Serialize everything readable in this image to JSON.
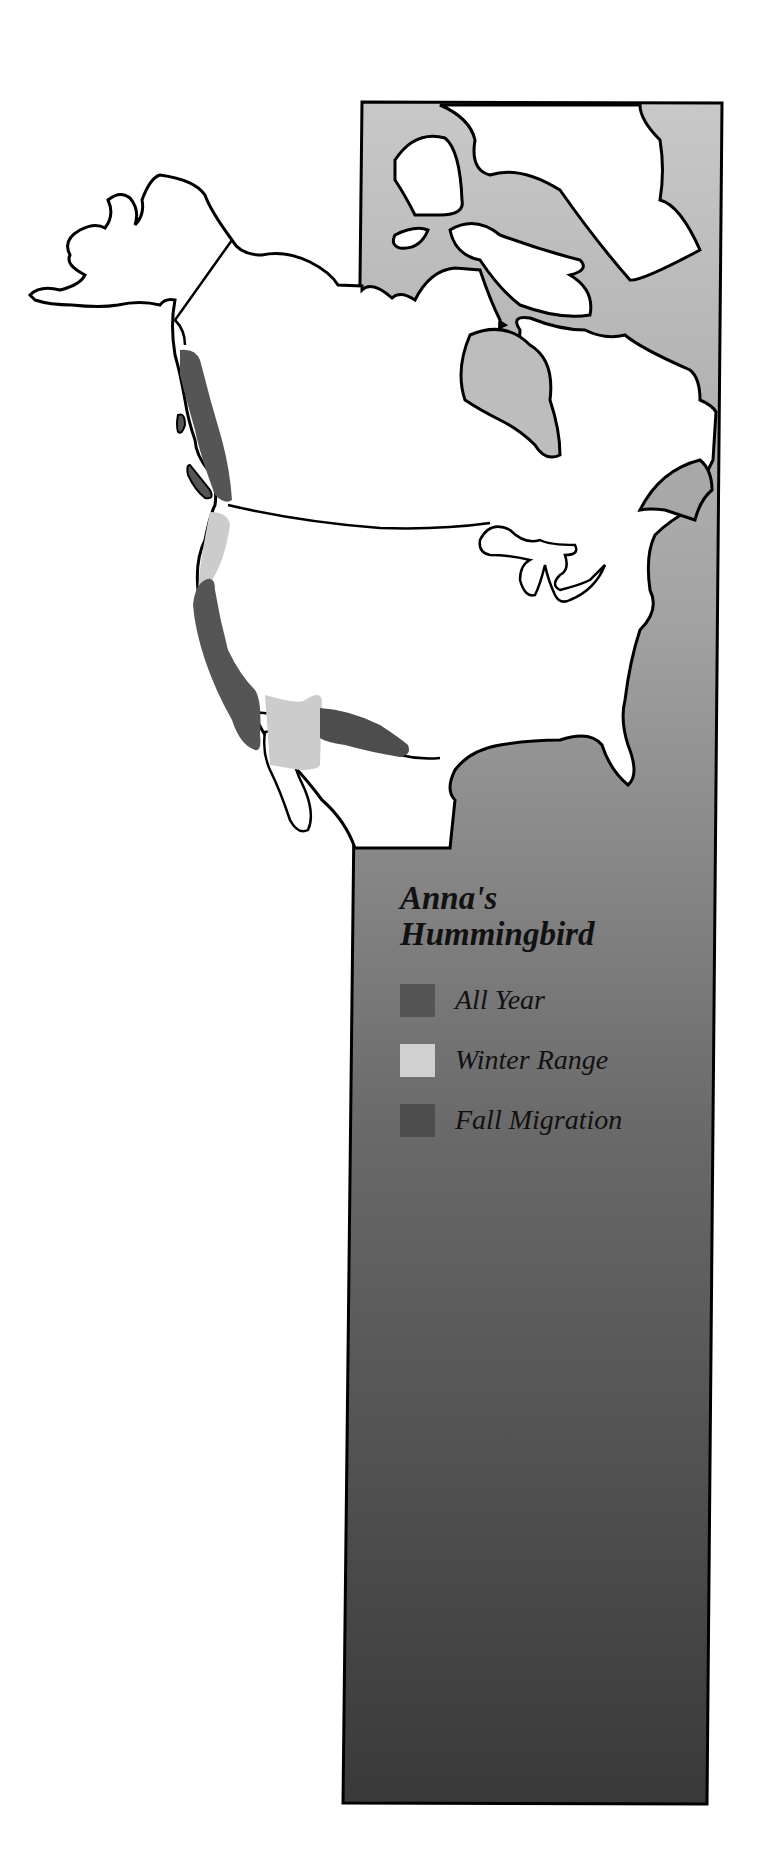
{
  "map": {
    "title_line1": "Anna's",
    "title_line2": "Hummingbird",
    "region": "North America",
    "legend": [
      {
        "label": "All Year",
        "color": "#555555"
      },
      {
        "label": "Winter Range",
        "color": "#cccccc"
      },
      {
        "label": "Fall Migration",
        "color": "#4d4d4d"
      }
    ],
    "colors": {
      "land": "#ffffff",
      "outline": "#000000",
      "water_top": "#c4c4c4",
      "water_bottom": "#3a3a3a",
      "all_year": "#555555",
      "winter_range": "#cccccc",
      "fall_migration": "#4d4d4d"
    }
  }
}
